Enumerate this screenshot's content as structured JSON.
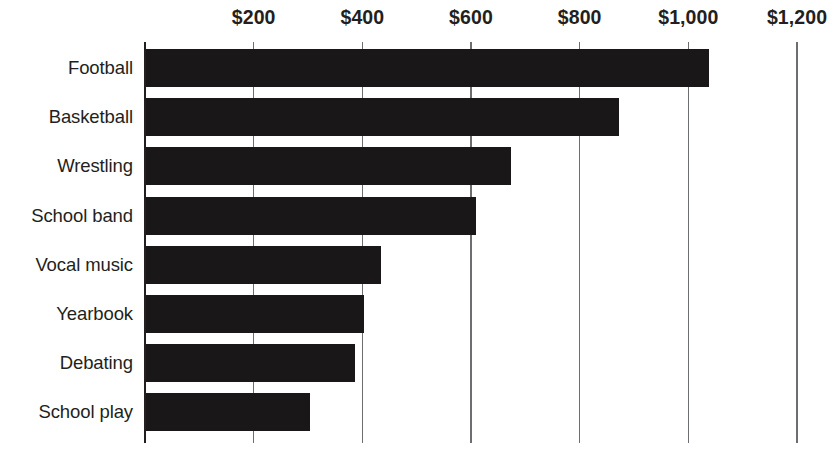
{
  "chart_data": {
    "type": "bar",
    "orientation": "horizontal",
    "title": "",
    "subtitle": "",
    "xlabel": "",
    "ylabel": "",
    "categories": [
      "Football",
      "Basketball",
      "Wrestling",
      "School band",
      "Vocal music",
      "Yearbook",
      "Debating",
      "School play"
    ],
    "values": [
      1036,
      870,
      671,
      608,
      433,
      402,
      385,
      302
    ],
    "series": [
      {
        "name": "Cost per student",
        "values": [
          1036,
          870,
          671,
          608,
          433,
          402,
          385,
          302
        ]
      }
    ],
    "xlim": [
      0,
      1200
    ],
    "ylim": null,
    "x_ticks": [
      0,
      200,
      400,
      600,
      800,
      1000,
      1200
    ],
    "x_tick_labels": [
      "",
      "$200",
      "$400",
      "$600",
      "$800",
      "$1,000",
      "$1,200"
    ],
    "x_tick_labels_visible": [
      "$200",
      "$400",
      "$600",
      "$800",
      "$1,000",
      "$1,200"
    ],
    "grid": true,
    "grid_axis": "x",
    "legend": false,
    "legend_position": "none",
    "annotations": [],
    "bar_color": "#1a1718",
    "gridline_color": "#6d6e71",
    "axis_color": "#231f20",
    "text_color": "#231f20",
    "background_color": "#ffffff"
  }
}
